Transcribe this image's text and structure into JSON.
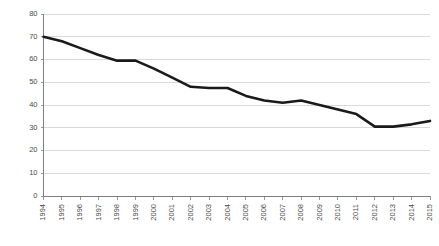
{
  "chart_data": {
    "type": "line",
    "title": "",
    "subtitle": "",
    "xlabel": "",
    "ylabel": "",
    "categories": [
      "1994",
      "1995",
      "1996",
      "1997",
      "1998",
      "1999",
      "2000",
      "2001",
      "2002",
      "2003",
      "2004",
      "2005",
      "2006",
      "2007",
      "2008",
      "2009",
      "2010",
      "2011",
      "2012",
      "2013",
      "2014",
      "2015"
    ],
    "series": [
      {
        "name": "",
        "values": [
          70,
          68,
          65,
          62,
          59.5,
          59.5,
          56,
          52,
          48,
          47.5,
          47.5,
          44,
          42,
          41,
          42,
          40,
          38,
          36,
          30.5,
          30.5,
          31.5,
          33
        ]
      }
    ],
    "ylim": [
      0,
      80
    ],
    "ytick_values": [
      0,
      10,
      20,
      30,
      40,
      50,
      60,
      70,
      80
    ],
    "ytick_labels": [
      "0",
      "10",
      "20",
      "30",
      "40",
      "50",
      "60",
      "70",
      "80"
    ],
    "grid": true,
    "grid_axis": "y",
    "legend": false,
    "legend_position": "none",
    "line_color": "#1a1a1a",
    "grid_color": "#d0d0d0",
    "axis_color": "#808080",
    "background_color": "#ffffff",
    "xtick_rotation": 90
  }
}
